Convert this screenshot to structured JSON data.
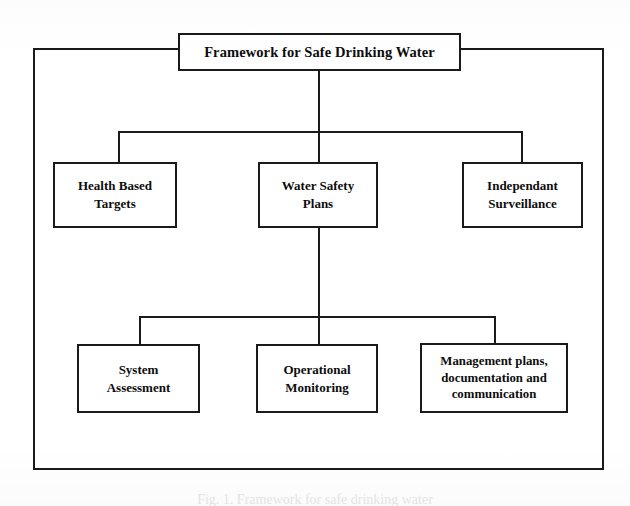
{
  "figure": {
    "type": "hierarchy-diagram",
    "title": "Framework for Safe Drinking Water",
    "caption": "Fig. 1. Framework for safe drinking water"
  },
  "nodes": {
    "root": {
      "id": "framework-for-safe-drinking-water",
      "label": "Framework for Safe Drinking Water",
      "level": 0
    },
    "level2": [
      {
        "id": "health-based-targets",
        "label": "Health Based\nTargets",
        "lines": [
          "Health Based",
          "Targets"
        ]
      },
      {
        "id": "water-safety-plans",
        "label": "Water Safety\nPlans",
        "lines": [
          "Water Safety",
          "Plans"
        ]
      },
      {
        "id": "independant-surveillance",
        "label": "Independant\nSurveillance",
        "lines": [
          "Independant",
          "Surveillance"
        ]
      }
    ],
    "level3": [
      {
        "id": "system-assessment",
        "label": "System\nAssessment",
        "lines": [
          "System",
          "Assessment"
        ]
      },
      {
        "id": "operational-monitoring",
        "label": "Operational\nMonitoring",
        "lines": [
          "Operational",
          "Monitoring"
        ]
      },
      {
        "id": "management-plans",
        "label": "Management plans,\ndocumentation and\ncommunication",
        "lines": [
          "Management plans,",
          "documentation and",
          "communication"
        ]
      }
    ]
  },
  "edges": [
    {
      "from": "framework-for-safe-drinking-water",
      "to": "health-based-targets"
    },
    {
      "from": "framework-for-safe-drinking-water",
      "to": "water-safety-plans"
    },
    {
      "from": "framework-for-safe-drinking-water",
      "to": "independant-surveillance"
    },
    {
      "from": "water-safety-plans",
      "to": "system-assessment"
    },
    {
      "from": "water-safety-plans",
      "to": "operational-monitoring"
    },
    {
      "from": "water-safety-plans",
      "to": "management-plans"
    }
  ],
  "colors": {
    "stroke": "#1a1a1a",
    "background": "#ffffff",
    "text": "#0d0d0d"
  }
}
